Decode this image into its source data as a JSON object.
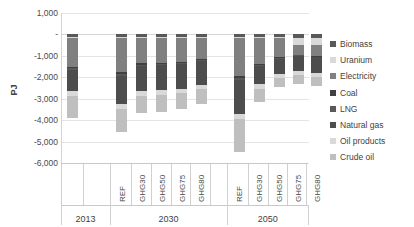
{
  "chart_data": {
    "type": "bar",
    "subtype": "stacked-bar-negative",
    "title": "",
    "xlabel": "",
    "ylabel": "PJ",
    "ylim": [
      -6000,
      1000
    ],
    "ytick_step": 1000,
    "grid": true,
    "legend_position": "right",
    "ytick_labels": [
      "1,000",
      "-",
      "-1,000",
      "-2,000",
      "-3,000",
      "-4,000",
      "-5,000",
      "-6,000"
    ],
    "ytick_values": [
      1000,
      0,
      -1000,
      -2000,
      -3000,
      -4000,
      -5000,
      -6000
    ],
    "groups": [
      {
        "label": "2013",
        "categories": [
          ""
        ]
      },
      {
        "label": "2030",
        "categories": [
          "REF",
          "GHG30",
          "GHG50",
          "GHG75",
          "GHG80"
        ]
      },
      {
        "label": "2050",
        "categories": [
          "REF",
          "GHG30",
          "GHG50",
          "GHG75",
          "GHG80"
        ]
      }
    ],
    "categories": [
      "2013",
      "2030 REF",
      "2030 GHG30",
      "2030 GHG50",
      "2030 GHG75",
      "2030 GHG80",
      "2050 REF",
      "2050 GHG30",
      "2050 GHG50",
      "2050 GHG75",
      "2050 GHG80"
    ],
    "series": [
      {
        "name": "Biomass",
        "color": "#595959",
        "values": [
          -120,
          -130,
          -120,
          -120,
          -120,
          -120,
          -130,
          -130,
          -140,
          -150,
          -150
        ]
      },
      {
        "name": "Uranium",
        "color": "#d9d9d9",
        "values": [
          -40,
          -40,
          -40,
          -40,
          -40,
          -40,
          -40,
          -40,
          -40,
          -330,
          -330
        ]
      },
      {
        "name": "Electricity",
        "color": "#808080",
        "values": [
          -1340,
          -1600,
          -1180,
          -1180,
          -1110,
          -1000,
          -1790,
          -1190,
          -870,
          -460,
          -520
        ]
      },
      {
        "name": "Coal",
        "color": "#404040",
        "values": [
          -80,
          -90,
          -70,
          -60,
          -60,
          -50,
          -90,
          -60,
          -60,
          -40,
          -40
        ]
      },
      {
        "name": "LNG",
        "color": "#595959",
        "values": [
          -60,
          -60,
          -50,
          -50,
          -40,
          -40,
          -60,
          -50,
          -40,
          -30,
          -30
        ]
      },
      {
        "name": "Natural gas",
        "color": "#4d4d4d",
        "values": [
          -1020,
          -1340,
          -1170,
          -1140,
          -1170,
          -1100,
          -1590,
          -860,
          -680,
          -680,
          -730
        ]
      },
      {
        "name": "Oil products",
        "color": "#d9d9d9",
        "values": [
          -200,
          -240,
          -230,
          -220,
          -210,
          -210,
          -270,
          -230,
          -220,
          -210,
          -210
        ]
      },
      {
        "name": "Crude oil",
        "color": "#bfbfbf",
        "values": [
          -1040,
          -1040,
          -830,
          -810,
          -730,
          -700,
          -1510,
          -600,
          -420,
          -400,
          -400
        ]
      }
    ],
    "totals": [
      -3900,
      -4540,
      -3690,
      -3620,
      -3480,
      -3260,
      -5480,
      -3160,
      -2470,
      -2300,
      -2410
    ]
  },
  "legend": {
    "items": [
      {
        "label": "Biomass",
        "swatch": "legend-swatch-biomass"
      },
      {
        "label": "Uranium",
        "swatch": "legend-swatch-uranium"
      },
      {
        "label": "Electricity",
        "swatch": "legend-swatch-electricity"
      },
      {
        "label": "Coal",
        "swatch": "legend-swatch-coal"
      },
      {
        "label": "LNG",
        "swatch": "legend-swatch-lng"
      },
      {
        "label": "Natural gas",
        "swatch": "legend-swatch-natural-gas"
      },
      {
        "label": "Oil products",
        "swatch": "legend-swatch-oil-products"
      },
      {
        "label": "Crude oil",
        "swatch": "legend-swatch-crude-oil"
      }
    ]
  }
}
